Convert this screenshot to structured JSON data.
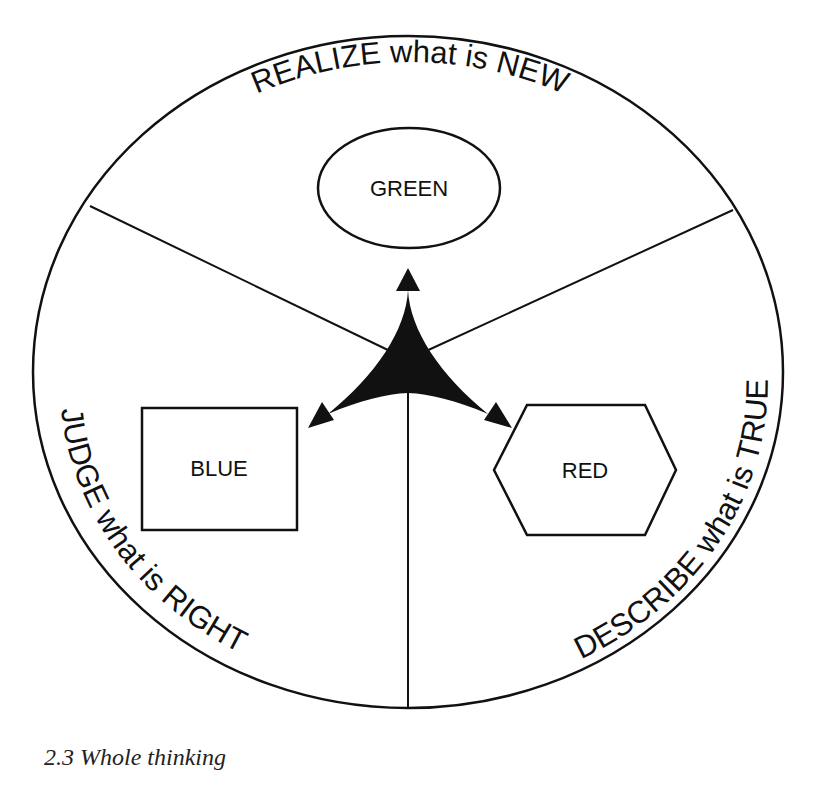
{
  "diagram": {
    "title": "Whole thinking",
    "colors": {
      "stroke": "#111111",
      "fill": "#111111",
      "background": "#ffffff"
    },
    "outer_ellipse": {
      "cx": 408,
      "cy": 372,
      "rx": 375,
      "ry": 336
    },
    "center": {
      "x": 408,
      "y": 356
    },
    "dividers": [
      {
        "from": [
          90,
          206
        ],
        "to": [
          392,
          352
        ]
      },
      {
        "from": [
          733,
          210
        ],
        "to": [
          424,
          352
        ]
      },
      {
        "from": [
          408,
          708
        ],
        "to": [
          408,
          390
        ]
      }
    ],
    "sectors": [
      {
        "id": "top",
        "arc_text": "REALIZE what is NEW",
        "shape": {
          "type": "ellipse",
          "label": "GREEN",
          "cx": 409,
          "cy": 188,
          "rx": 91,
          "ry": 60
        }
      },
      {
        "id": "left",
        "arc_text": "JUDGE what is RIGHT",
        "shape": {
          "type": "rectangle",
          "label": "BLUE",
          "x": 142,
          "y": 408,
          "w": 155,
          "h": 122
        }
      },
      {
        "id": "right",
        "arc_text": "DESCRIBE what is TRUE",
        "shape": {
          "type": "hexagon",
          "label": "RED",
          "points": "494,470 527,405 645,405 676,470 645,535 527,535"
        }
      }
    ],
    "center_symbol": "three-way-arrow (black curved triangle with arrowheads pointing to GREEN, BLUE, RED)"
  },
  "caption": {
    "number": "2.3",
    "text": "2.3 Whole thinking"
  }
}
